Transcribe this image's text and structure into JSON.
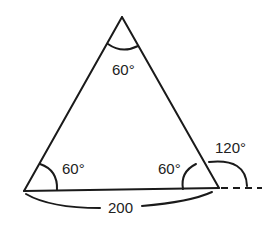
{
  "diagram": {
    "type": "triangle",
    "angles": {
      "top": "60°",
      "bottom_left": "60°",
      "bottom_right": "60°",
      "exterior_right": "120°"
    },
    "base_length": "200",
    "colors": {
      "stroke": "#1a1a1a",
      "text": "#222222",
      "background": "#ffffff"
    }
  }
}
